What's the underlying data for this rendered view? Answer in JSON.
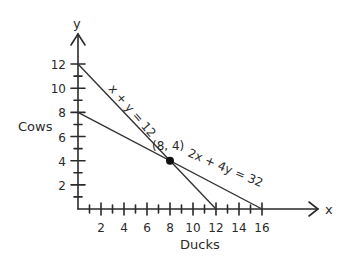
{
  "chart_data": {
    "type": "line",
    "title": "",
    "xlabel": "Ducks",
    "ylabel": "Cows",
    "x_axis_letter": "x",
    "y_axis_letter": "y",
    "xlim": [
      0,
      16
    ],
    "ylim": [
      0,
      12
    ],
    "x_ticks": [
      2,
      4,
      6,
      8,
      10,
      12,
      14,
      16
    ],
    "y_ticks": [
      2,
      4,
      6,
      8,
      10,
      12
    ],
    "grid": false,
    "series": [
      {
        "name": "x + y = 12",
        "points": [
          [
            0,
            12
          ],
          [
            12,
            0
          ]
        ]
      },
      {
        "name": "2x + 4y = 32",
        "points": [
          [
            0,
            8
          ],
          [
            16,
            0
          ]
        ]
      }
    ],
    "annotations": [
      {
        "text": "(8, 4)",
        "x": 8,
        "y": 4,
        "marker": "filled-dot"
      },
      {
        "text": "x + y = 12",
        "along_series": 0
      },
      {
        "text": "2x + 4y = 32",
        "along_series": 1
      }
    ]
  },
  "labels": {
    "xlabel": "Ducks",
    "ylabel": "Cows",
    "x_letter": "x",
    "y_letter": "y",
    "eq1": "x + y = 12",
    "eq2": "2x + 4y = 32",
    "point": "(8, 4)"
  }
}
